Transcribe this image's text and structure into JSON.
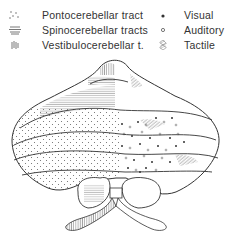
{
  "legend": {
    "tracts": [
      {
        "label": "Pontocerebellar tract",
        "symbol": "fine-dots"
      },
      {
        "label": "Spinocerebellar tracts",
        "symbol": "horizontal-lines"
      },
      {
        "label": "Vestibulocerebellar t.",
        "symbol": "vertical-lines"
      }
    ],
    "senses": [
      {
        "label": "Visual",
        "symbol": "filled-dot"
      },
      {
        "label": "Auditory",
        "symbol": "open-circle"
      },
      {
        "label": "Tactile",
        "symbol": "diagonal-hatch"
      }
    ]
  },
  "diagram": {
    "line_color": "#333333",
    "background": "#ffffff"
  }
}
